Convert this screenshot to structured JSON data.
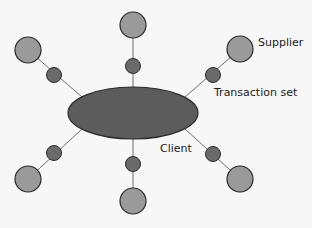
{
  "labels": {
    "supplier": "Supplier",
    "transaction_set": "Transaction set",
    "client": "Client"
  },
  "colors": {
    "background": "#f7f7f7",
    "client_fill": "#5c5c5c",
    "transaction_fill": "#6a6a6a",
    "supplier_fill": "#9a9a9a",
    "stroke": "#2a2a2a",
    "line": "#6e6e6e"
  },
  "nodes": {
    "client": {
      "cx": 133,
      "cy": 113,
      "rx": 65,
      "ry": 26
    },
    "spokes": [
      {
        "name": "top",
        "sx": 133,
        "sy": 25,
        "tx": 133,
        "ty": 66,
        "ex": 133,
        "ey": 87
      },
      {
        "name": "top-left",
        "sx": 28,
        "sy": 50,
        "tx": 54,
        "ty": 75,
        "ex": 82,
        "ey": 97
      },
      {
        "name": "top-right",
        "sx": 240,
        "sy": 49,
        "tx": 213,
        "ty": 75,
        "ex": 185,
        "ey": 97
      },
      {
        "name": "bottom-left",
        "sx": 28,
        "sy": 179,
        "tx": 54,
        "ty": 153,
        "ex": 82,
        "ey": 129
      },
      {
        "name": "bottom",
        "sx": 133,
        "sy": 201,
        "tx": 133,
        "ty": 164,
        "ex": 133,
        "ey": 139
      },
      {
        "name": "bottom-right",
        "sx": 240,
        "sy": 179,
        "tx": 213,
        "ty": 154,
        "ex": 185,
        "ey": 129
      }
    ]
  }
}
